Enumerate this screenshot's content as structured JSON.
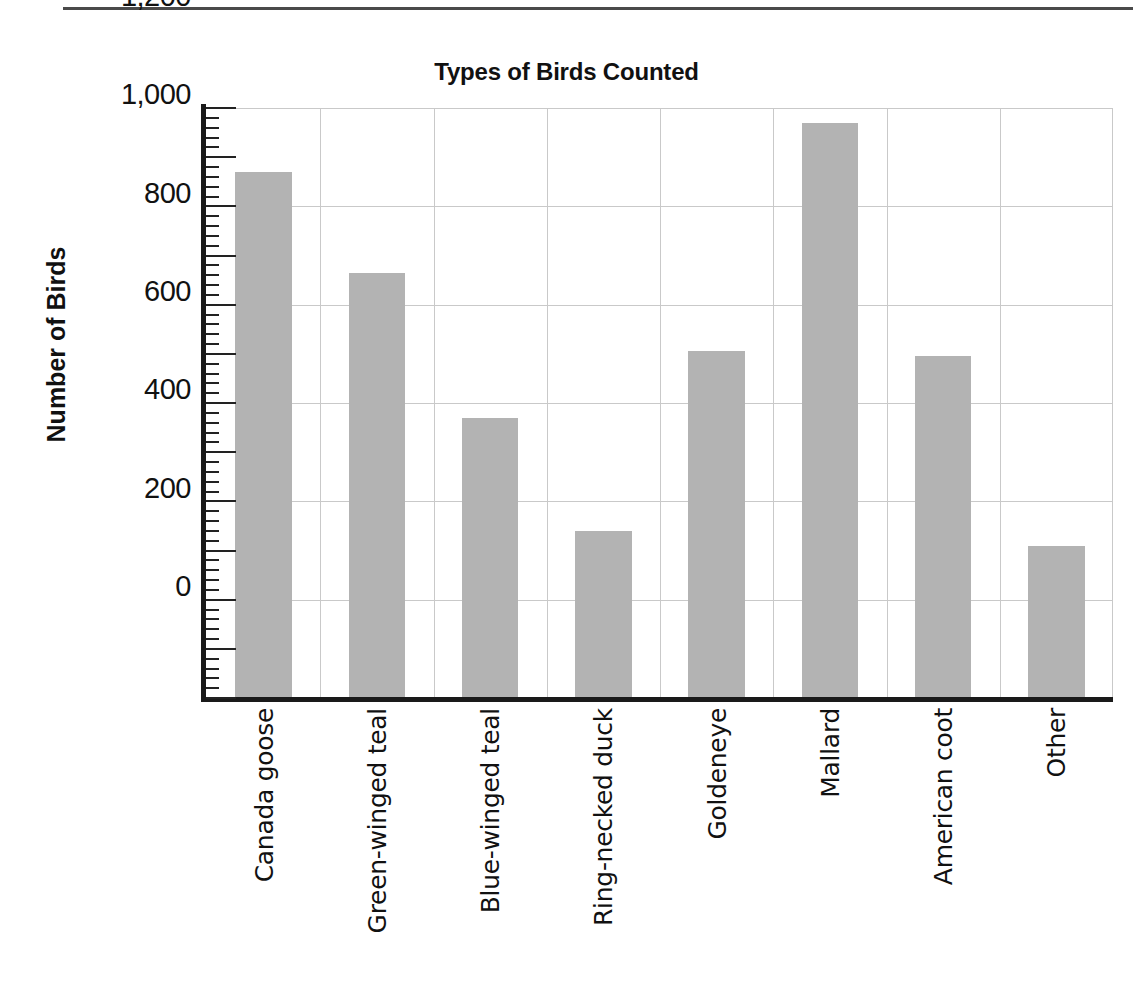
{
  "chart_data": {
    "type": "bar",
    "title": "Types of Birds Counted",
    "xlabel": "",
    "ylabel": "Number of Birds",
    "categories": [
      "Canada goose",
      "Green-winged teal",
      "Blue-winged teal",
      "Ring-necked duck",
      "Goldeneye",
      "Mallard",
      "American coot",
      "Other"
    ],
    "values": [
      1070,
      865,
      570,
      340,
      705,
      1170,
      695,
      310
    ],
    "ylim": [
      0,
      1200
    ],
    "ytick_labels": [
      "0",
      "200",
      "400",
      "600",
      "800",
      "1,000",
      "1,200"
    ],
    "ytick_values": [
      0,
      200,
      400,
      600,
      800,
      1000,
      1200
    ],
    "major_tick_step": 100,
    "minor_tick_step": 20,
    "grid": "both",
    "legend": "none",
    "bar_color": "#b3b3b3",
    "axis_color": "#1a1a1a",
    "grid_color": "#c9c9c9"
  }
}
